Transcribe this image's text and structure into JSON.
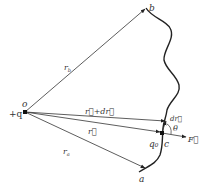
{
  "diagram": {
    "source_charge": {
      "label": "+q",
      "point_label": "o"
    },
    "points": {
      "a": "a",
      "b": "b",
      "c": "c"
    },
    "test_charge": "q₀",
    "vectors": {
      "r_b": "r",
      "r_b_sub": "b",
      "r_a": "r",
      "r_a_sub": "a",
      "r": "r⃗",
      "r_plus_dr": "r⃗+dr⃗",
      "dr": "dr⃗",
      "force": "F⃗"
    },
    "angle": "θ",
    "colors": {
      "line": "#333333",
      "background": "#ffffff"
    }
  }
}
